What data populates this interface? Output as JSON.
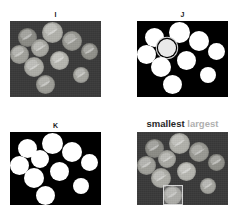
{
  "figure": {
    "background_color": "#ffffff",
    "panels": [
      {
        "id": "I",
        "label": "I",
        "kind": "photo",
        "caption_parts": [],
        "frame": {
          "x": 10,
          "y": 21,
          "w": 91,
          "h": 76
        },
        "label_pos": {
          "x": 10,
          "y": 11,
          "w": 91
        },
        "background_color": "#3a3a3a",
        "object_color": "#9a9a9a",
        "objects": [
          {
            "cx": 17,
            "cy": 16,
            "r": 9.5
          },
          {
            "cx": 42,
            "cy": 11,
            "r": 10.5
          },
          {
            "cx": 30,
            "cy": 27,
            "r": 9.0
          },
          {
            "cx": 9,
            "cy": 33,
            "r": 9.5
          },
          {
            "cx": 62,
            "cy": 20,
            "r": 10.0
          },
          {
            "cx": 79,
            "cy": 30,
            "r": 8.5
          },
          {
            "cx": 49,
            "cy": 39,
            "r": 9.5
          },
          {
            "cx": 24,
            "cy": 46,
            "r": 10.0
          },
          {
            "cx": 71,
            "cy": 54,
            "r": 8.0
          },
          {
            "cx": 35,
            "cy": 63,
            "r": 9.5
          }
        ]
      },
      {
        "id": "J",
        "label": "J",
        "kind": "binary",
        "caption_parts": [],
        "frame": {
          "x": 137,
          "y": 21,
          "w": 91,
          "h": 76
        },
        "label_pos": {
          "x": 137,
          "y": 11,
          "w": 91
        },
        "background_color": "#000000",
        "object_color": "#ffffff",
        "objects": [
          {
            "cx": 17,
            "cy": 16,
            "r": 9.5
          },
          {
            "cx": 42,
            "cy": 11,
            "r": 10.5
          },
          {
            "cx": 30,
            "cy": 27,
            "r": 9.0,
            "ringed": true
          },
          {
            "cx": 9,
            "cy": 33,
            "r": 9.5
          },
          {
            "cx": 62,
            "cy": 20,
            "r": 10.0
          },
          {
            "cx": 79,
            "cy": 30,
            "r": 8.5
          },
          {
            "cx": 49,
            "cy": 39,
            "r": 9.5
          },
          {
            "cx": 24,
            "cy": 46,
            "r": 10.0
          },
          {
            "cx": 71,
            "cy": 54,
            "r": 8.0
          },
          {
            "cx": 35,
            "cy": 63,
            "r": 9.5
          }
        ]
      },
      {
        "id": "K",
        "label": "K",
        "kind": "binary",
        "caption_parts": [],
        "frame": {
          "x": 10,
          "y": 132,
          "w": 91,
          "h": 73
        },
        "label_pos": {
          "x": 10,
          "y": 122,
          "w": 91
        },
        "background_color": "#000000",
        "object_color": "#ffffff",
        "objects": [
          {
            "cx": 17,
            "cy": 16,
            "r": 9.5
          },
          {
            "cx": 42,
            "cy": 11,
            "r": 10.5
          },
          {
            "cx": 30,
            "cy": 27,
            "r": 9.0
          },
          {
            "cx": 9,
            "cy": 33,
            "r": 9.5
          },
          {
            "cx": 62,
            "cy": 20,
            "r": 10.0
          },
          {
            "cx": 79,
            "cy": 30,
            "r": 8.5
          },
          {
            "cx": 49,
            "cy": 39,
            "r": 9.5
          },
          {
            "cx": 24,
            "cy": 46,
            "r": 10.0
          },
          {
            "cx": 71,
            "cy": 54,
            "r": 8.0
          },
          {
            "cx": 35,
            "cy": 63,
            "r": 9.5
          }
        ]
      },
      {
        "id": "L",
        "label": "",
        "kind": "photo",
        "caption_parts": [
          {
            "text": "smallest",
            "color": "#262626"
          },
          {
            "text": "largest",
            "color": "#b0b0b0"
          }
        ],
        "frame": {
          "x": 137,
          "y": 132,
          "w": 91,
          "h": 73
        },
        "label_pos": {
          "x": 137,
          "y": 118,
          "w": 91
        },
        "background_color": "#3a3a3a",
        "object_color": "#9a9a9a",
        "objects": [
          {
            "cx": 17,
            "cy": 16,
            "r": 9.5
          },
          {
            "cx": 42,
            "cy": 11,
            "r": 10.5
          },
          {
            "cx": 30,
            "cy": 27,
            "r": 9.0
          },
          {
            "cx": 9,
            "cy": 33,
            "r": 9.5
          },
          {
            "cx": 62,
            "cy": 20,
            "r": 10.0
          },
          {
            "cx": 79,
            "cy": 30,
            "r": 8.5
          },
          {
            "cx": 49,
            "cy": 39,
            "r": 9.5
          },
          {
            "cx": 24,
            "cy": 46,
            "r": 10.0
          },
          {
            "cx": 71,
            "cy": 54,
            "r": 8.0
          },
          {
            "cx": 35,
            "cy": 63,
            "r": 9.5
          }
        ],
        "boxes": [
          {
            "name": "smallest-bbox",
            "x": 26,
            "y": 53,
            "w": 20,
            "h": 20
          }
        ]
      }
    ]
  },
  "chart_data": {
    "type": "scatter",
    "xlabel": "",
    "ylabel": "",
    "panel_labels": [
      "I",
      "J",
      "K",
      "smallest largest"
    ],
    "annotations": [
      "smallest",
      "largest"
    ],
    "series": [
      {
        "name": "panel-I-coins",
        "x": [
          17,
          42,
          30,
          9,
          62,
          79,
          49,
          24,
          71,
          35
        ],
        "y": [
          16,
          11,
          27,
          33,
          20,
          30,
          39,
          46,
          54,
          63
        ],
        "r": [
          9.5,
          10.5,
          9.0,
          9.5,
          10.0,
          8.5,
          9.5,
          10.0,
          8.0,
          9.5
        ]
      },
      {
        "name": "panel-J-blobs",
        "x": [
          17,
          42,
          30,
          9,
          62,
          79,
          49,
          24,
          71,
          35
        ],
        "y": [
          16,
          11,
          27,
          33,
          20,
          30,
          39,
          46,
          54,
          63
        ],
        "r": [
          9.5,
          10.5,
          9.0,
          9.5,
          10.0,
          8.5,
          9.5,
          10.0,
          8.0,
          9.5
        ]
      },
      {
        "name": "panel-K-blobs",
        "x": [
          17,
          42,
          30,
          9,
          62,
          79,
          49,
          24,
          71,
          35
        ],
        "y": [
          16,
          11,
          27,
          33,
          20,
          30,
          39,
          46,
          54,
          63
        ],
        "r": [
          9.5,
          10.5,
          9.0,
          9.5,
          10.0,
          8.5,
          9.5,
          10.0,
          8.0,
          9.5
        ]
      },
      {
        "name": "panel-L-coins",
        "x": [
          17,
          42,
          30,
          9,
          62,
          79,
          49,
          24,
          71,
          35
        ],
        "y": [
          16,
          11,
          27,
          33,
          20,
          30,
          39,
          46,
          54,
          63
        ],
        "r": [
          9.5,
          10.5,
          9.0,
          9.5,
          10.0,
          8.5,
          9.5,
          10.0,
          8.0,
          9.5
        ]
      }
    ],
    "legend_position": "top",
    "grid": false
  }
}
